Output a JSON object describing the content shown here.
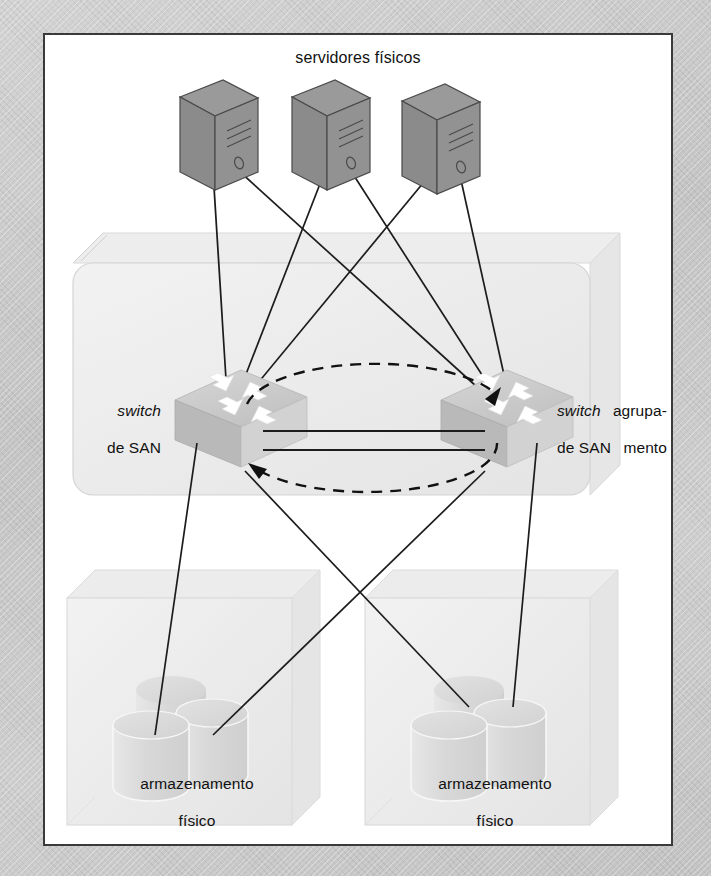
{
  "figure": {
    "title": "servidores físicos",
    "background_color": "#c9c9c9",
    "frame_color": "#3a3a3a",
    "canvas_color": "#ffffff"
  },
  "labels": {
    "servers_title": "servidores físicos",
    "switch_left_line1": "switch",
    "switch_left_line2": "de SAN",
    "switch_right_line1": "switch",
    "switch_right_line2": "de SAN",
    "cluster_line1": "agrupa-",
    "cluster_line2": "mento",
    "storage_left_line1": "armazenamento",
    "storage_left_line2": "físico",
    "storage_right_line1": "armazenamento",
    "storage_right_line2": "físico"
  },
  "nodes": {
    "servers": [
      {
        "name": "server-1",
        "icon": "tower-server-icon"
      },
      {
        "name": "server-2",
        "icon": "tower-server-icon"
      },
      {
        "name": "server-3",
        "icon": "tower-server-icon"
      }
    ],
    "switches": [
      {
        "name": "san-switch-left",
        "icon": "network-switch-icon",
        "label": "switch de SAN"
      },
      {
        "name": "san-switch-right",
        "icon": "network-switch-icon",
        "label": "switch de SAN"
      }
    ],
    "storage_boxes": [
      {
        "name": "storage-enclosure-left",
        "icon": "disk-cylinder-icon",
        "disk_count": 3,
        "label": "armazenamento físico"
      },
      {
        "name": "storage-enclosure-right",
        "icon": "disk-cylinder-icon",
        "disk_count": 3,
        "label": "armazenamento físico"
      }
    ],
    "cluster_box": {
      "name": "cluster-container",
      "label": "agrupamento"
    }
  },
  "connections": {
    "server_to_switch_count": 6,
    "switch_to_storage_count": 4,
    "inter_switch_links": 2,
    "dashed_ring": {
      "style": "dashed-ellipse",
      "arrowheads": 2
    }
  },
  "colors": {
    "server_fill": "#8f8f8f",
    "server_side": "#7c7c7c",
    "server_top": "#9a9a9a",
    "switch_top": "#c9c9c9",
    "switch_left": "#bdbdbd",
    "switch_right": "#d6d6d6",
    "arrow_white": "#ffffff",
    "box_fill": "#eeeeee",
    "cylinder_fill": "#dedede",
    "line": "#1c1c1c"
  }
}
